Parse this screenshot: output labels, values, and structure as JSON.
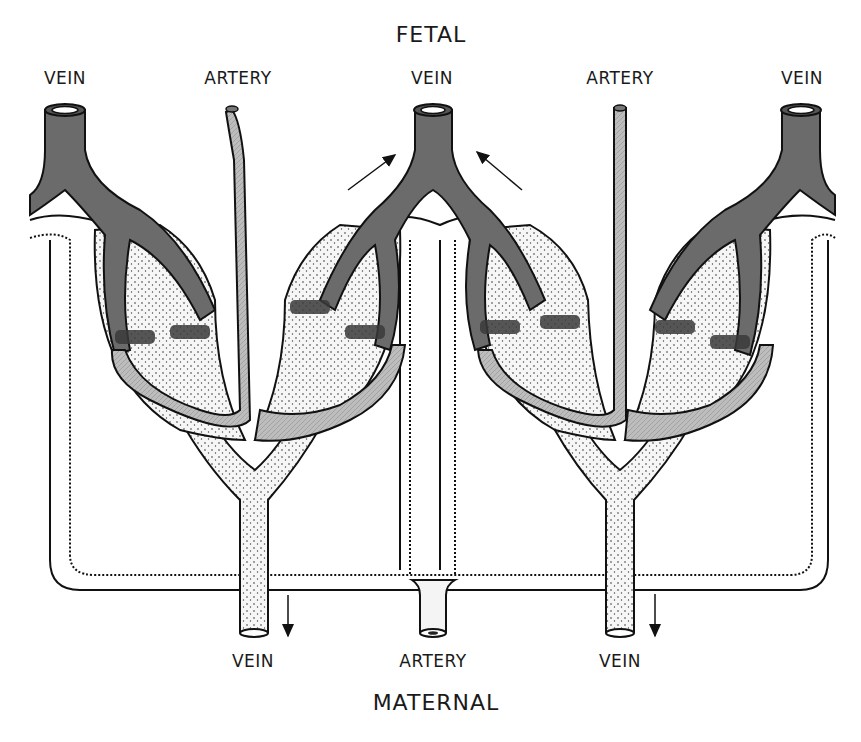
{
  "diagram": {
    "title_top": "FETAL",
    "title_bottom": "MATERNAL",
    "fetal_labels": [
      {
        "text": "VEIN",
        "x": 58,
        "y": 70
      },
      {
        "text": "ARTERY",
        "x": 240,
        "y": 70
      },
      {
        "text": "VEIN",
        "x": 432,
        "y": 70
      },
      {
        "text": "ARTERY",
        "x": 621,
        "y": 70
      },
      {
        "text": "VEIN",
        "x": 803,
        "y": 70
      }
    ],
    "maternal_labels": [
      {
        "text": "VEIN",
        "x": 253,
        "y": 653
      },
      {
        "text": "ARTERY",
        "x": 433,
        "y": 653
      },
      {
        "text": "VEIN",
        "x": 620,
        "y": 653
      }
    ],
    "colors": {
      "fetal_vein": "#6b6b6b",
      "fetal_vein_dark": "#3a3a3a",
      "fetal_artery": "#b8b8b8",
      "maternal_vessel": "#f4f4f4",
      "outline": "#111111"
    },
    "flow_arrows": [
      {
        "direction": "up-right",
        "near": "central fetal vein, left"
      },
      {
        "direction": "up-left",
        "near": "central fetal vein, right"
      },
      {
        "direction": "down",
        "near": "maternal vein, left"
      },
      {
        "direction": "down",
        "near": "maternal vein, right"
      }
    ]
  }
}
